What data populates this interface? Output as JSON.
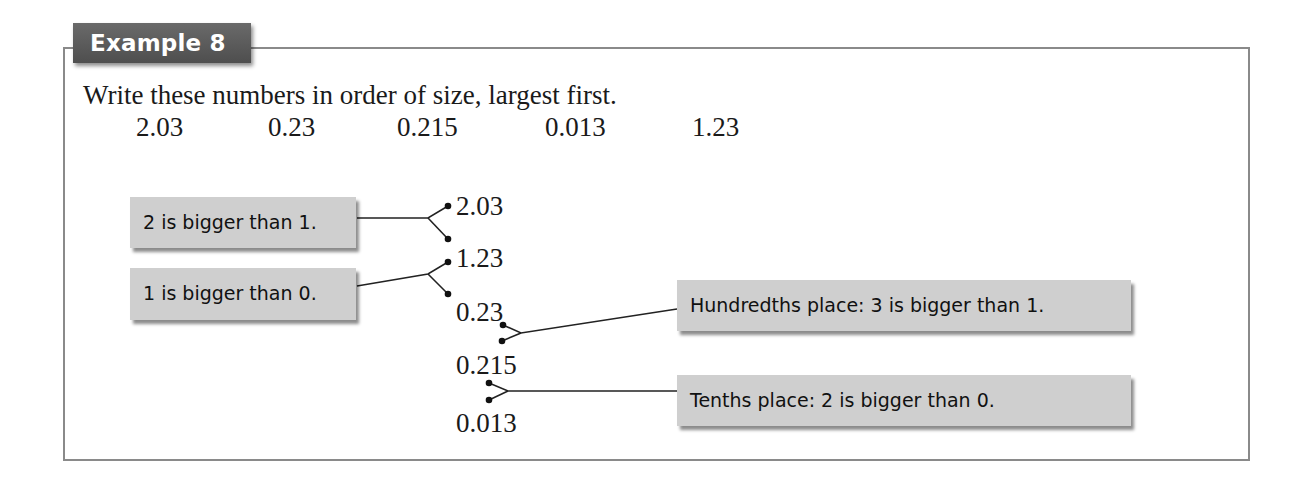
{
  "example": {
    "title": "Example 8"
  },
  "question": {
    "instruction": "Write these numbers in order of size, largest first.",
    "numbers": [
      "2.03",
      "0.23",
      "0.215",
      "0.013",
      "1.23"
    ]
  },
  "ordered": [
    "2.03",
    "1.23",
    "0.23",
    "0.215",
    "0.013"
  ],
  "explanations": [
    "2 is bigger than 1.",
    "1 is bigger than 0.",
    "Hundredths place: 3 is bigger than 1.",
    "Tenths place: 2 is bigger than 0."
  ],
  "colors": {
    "tab_bg": "#555555",
    "box_bg": "#cfcfcf",
    "frame": "#8a8a8a",
    "line": "#222222"
  }
}
